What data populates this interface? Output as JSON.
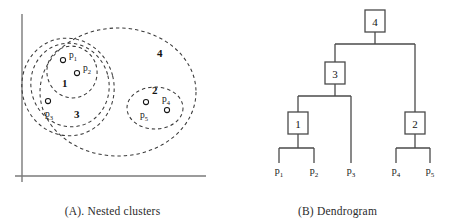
{
  "figure": {
    "panels": [
      {
        "id": "A",
        "caption": "(A). Nested clusters",
        "axes": {
          "show": true,
          "color": "#7a7a7a"
        },
        "points": [
          {
            "id": "p1",
            "label": "p",
            "sub": "1",
            "cx": 63,
            "cy": 60,
            "label_x": 69,
            "label_y": 58
          },
          {
            "id": "p2",
            "label": "p",
            "sub": "2",
            "cx": 77,
            "cy": 73,
            "label_x": 83,
            "label_y": 71
          },
          {
            "id": "p3",
            "label": "p",
            "sub": "3",
            "cx": 48,
            "cy": 101,
            "label_x": 45,
            "label_y": 117
          },
          {
            "id": "p4",
            "label": "p",
            "sub": "4",
            "cx": 167,
            "cy": 110,
            "label_x": 162,
            "label_y": 102
          },
          {
            "id": "p5",
            "label": "p",
            "sub": "5",
            "cx": 146,
            "cy": 102,
            "label_x": 140,
            "label_y": 118
          }
        ],
        "clusters": [
          {
            "id": "cluster-1",
            "number": "1",
            "label_x": 62,
            "label_y": 87,
            "cx": 72,
            "cy": 72,
            "rx": 25,
            "ry": 26,
            "rot": -18
          },
          {
            "id": "cluster-3",
            "number": "3",
            "label_x": 74,
            "label_y": 118,
            "cx": 70,
            "cy": 85,
            "rx": 39,
            "ry": 42,
            "rot": -14
          },
          {
            "id": "cluster-3-outer",
            "number": "",
            "label_x": 0,
            "label_y": 0,
            "cx": 68,
            "cy": 87,
            "rx": 46,
            "ry": 49,
            "rot": -14
          },
          {
            "id": "cluster-2",
            "number": "2",
            "label_x": 152,
            "label_y": 94,
            "cx": 155,
            "cy": 108,
            "rx": 28,
            "ry": 21,
            "rot": 0
          },
          {
            "id": "cluster-4",
            "number": "4",
            "label_x": 157,
            "label_y": 57,
            "cx": 118,
            "cy": 92,
            "rx": 78,
            "ry": 64,
            "rot": 0
          }
        ]
      },
      {
        "id": "B",
        "caption": "(B) Dendrogram",
        "nodes": [
          {
            "id": "node-4",
            "number": "4",
            "x": 375,
            "y": 21
          },
          {
            "id": "node-3",
            "number": "3",
            "x": 335,
            "y": 73
          },
          {
            "id": "node-1",
            "number": "1",
            "x": 298,
            "y": 123
          },
          {
            "id": "node-2",
            "number": "2",
            "x": 415,
            "y": 123
          }
        ],
        "leaves": [
          {
            "id": "leaf-p1",
            "label": "p",
            "sub": "1",
            "x": 279,
            "y": 174
          },
          {
            "id": "leaf-p2",
            "label": "p",
            "sub": "2",
            "x": 314,
            "y": 174
          },
          {
            "id": "leaf-p3",
            "label": "p",
            "sub": "3",
            "x": 351,
            "y": 174
          },
          {
            "id": "leaf-p4",
            "label": "p",
            "sub": "4",
            "x": 396,
            "y": 174
          },
          {
            "id": "leaf-p5",
            "label": "p",
            "sub": "5",
            "x": 430,
            "y": 174
          }
        ]
      }
    ],
    "colors": {
      "line": "#4a4a4a",
      "dash": "#3a3a3a",
      "axis": "#7a7a7a",
      "text": "#141414",
      "background": "#ffffff"
    }
  }
}
